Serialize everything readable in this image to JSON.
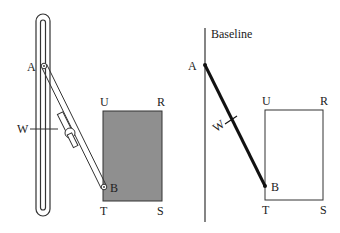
{
  "left_figure": {
    "labels": {
      "A": "A",
      "B": "B",
      "W": "W",
      "U": "U",
      "R": "R",
      "T": "T",
      "S": "S"
    },
    "fill_color": "#8f8f8f"
  },
  "right_figure": {
    "baseline_label": "Baseline",
    "labels": {
      "A": "A",
      "B": "B",
      "W": "W",
      "U": "U",
      "R": "R",
      "T": "T",
      "S": "S"
    }
  }
}
